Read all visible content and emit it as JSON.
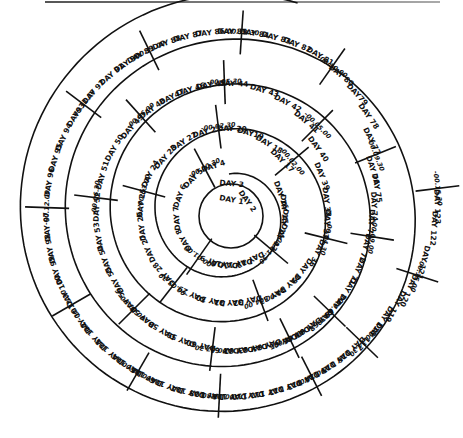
{
  "diagram": {
    "center": [
      229,
      214
    ],
    "spiral_turns": [
      {
        "turn": 1,
        "r_in": 0,
        "r_out": 40
      },
      {
        "turn": 2,
        "r_in": 40,
        "r_out": 70
      },
      {
        "turn": 3,
        "r_in": 70,
        "r_out": 112
      },
      {
        "turn": 4,
        "r_in": 112,
        "r_out": 155
      },
      {
        "turn": 5,
        "r_in": 155,
        "r_out": 200
      }
    ],
    "days": [
      {
        "label": "DAY 1",
        "a": -80,
        "r": 14
      },
      {
        "label": "DAY 2",
        "a": -35,
        "r": 22
      },
      {
        "label": "DAY 3",
        "a": -85,
        "r": 30
      },
      {
        "label": "DAY 4",
        "a": -108,
        "r": 50
      },
      {
        "label": "DAY 5",
        "a": -135,
        "r": 50
      },
      {
        "label": "DAY 6",
        "a": -160,
        "r": 52
      },
      {
        "label": "DAY 7",
        "a": 175,
        "r": 52
      },
      {
        "label": "DAY 8",
        "a": 150,
        "r": 52
      },
      {
        "label": "DAY 9",
        "a": 110,
        "r": 50
      },
      {
        "label": "DAY10",
        "a": 95,
        "r": 50
      },
      {
        "label": "DAY 11",
        "a": 80,
        "r": 50
      },
      {
        "label": "DAY 12",
        "a": 65,
        "r": 50
      },
      {
        "label": "DAY 13",
        "a": 25,
        "r": 55
      },
      {
        "label": "DAY 14",
        "a": 10,
        "r": 55
      },
      {
        "label": "DAY 15",
        "a": -5,
        "r": 55
      },
      {
        "label": "DAY 16",
        "a": -20,
        "r": 55
      },
      {
        "label": "DAY 17",
        "a": -45,
        "r": 75
      },
      {
        "label": "DAY 18",
        "a": -60,
        "r": 80
      },
      {
        "label": "DAY19",
        "a": -75,
        "r": 83
      },
      {
        "label": "DAY 20",
        "a": -88,
        "r": 85
      },
      {
        "label": "DAY 21",
        "a": -105,
        "r": 85
      },
      {
        "label": "DAY 22",
        "a": -122,
        "r": 85
      },
      {
        "label": "DAY 23",
        "a": -138,
        "r": 85
      },
      {
        "label": "DAY 24",
        "a": -153,
        "r": 88
      },
      {
        "label": "DAY 25",
        "a": -173,
        "r": 88
      },
      {
        "label": "DAY 26",
        "a": 172,
        "r": 88
      },
      {
        "label": "DAY 27",
        "a": 157,
        "r": 88
      },
      {
        "label": "DAY 28",
        "a": 137,
        "r": 88
      },
      {
        "label": "DAY 29",
        "a": 115,
        "r": 88
      },
      {
        "label": "DAY 30",
        "a": 102,
        "r": 88
      },
      {
        "label": "DAY 31",
        "a": 90,
        "r": 88
      },
      {
        "label": "DAY 32",
        "a": 78,
        "r": 88
      },
      {
        "label": "DAY 33",
        "a": 62,
        "r": 92
      },
      {
        "label": "DAY 34",
        "a": 50,
        "r": 92
      },
      {
        "label": "DAY 35",
        "a": 38,
        "r": 92
      },
      {
        "label": "DAY 36",
        "a": 24,
        "r": 96
      },
      {
        "label": "DAY 37",
        "a": 6,
        "r": 98
      },
      {
        "label": "DAY 38",
        "a": -7,
        "r": 98
      },
      {
        "label": "DAY 39",
        "a": -22,
        "r": 100
      },
      {
        "label": "DAY 40",
        "a": -36,
        "r": 110
      },
      {
        "label": "DAY 41",
        "a": -50,
        "r": 120
      },
      {
        "label": "DAY 42",
        "a": -62,
        "r": 125
      },
      {
        "label": "DAY 43",
        "a": -74,
        "r": 128
      },
      {
        "label": "DAY 44",
        "a": -88,
        "r": 130
      },
      {
        "label": "DAY 45",
        "a": -98,
        "r": 130
      },
      {
        "label": "DAY 46",
        "a": -107,
        "r": 130
      },
      {
        "label": "DAY47",
        "a": -116,
        "r": 130
      },
      {
        "label": "DAY 48",
        "a": -126,
        "r": 130
      },
      {
        "label": "DAY 49",
        "a": -138,
        "r": 130
      },
      {
        "label": "DAY 50",
        "a": -150,
        "r": 132
      },
      {
        "label": "DAY 51",
        "a": -163,
        "r": 132
      },
      {
        "label": "DAY 52",
        "a": -177,
        "r": 132
      },
      {
        "label": "DAY 53",
        "a": 170,
        "r": 132
      },
      {
        "label": "DAY 54",
        "a": 160,
        "r": 132
      },
      {
        "label": "DAY 55",
        "a": 150,
        "r": 132
      },
      {
        "label": "DAY 56",
        "a": 140,
        "r": 134
      },
      {
        "label": "DAY 57",
        "a": 130,
        "r": 134
      },
      {
        "label": "DAY 58",
        "a": 120,
        "r": 134
      },
      {
        "label": "DAY 59",
        "a": 111,
        "r": 134
      },
      {
        "label": "DAY 60",
        "a": 102,
        "r": 134
      },
      {
        "label": "DAY 61",
        "a": 92,
        "r": 136
      },
      {
        "label": "DAY 62",
        "a": 86,
        "r": 136
      },
      {
        "label": "DAY 63",
        "a": 80,
        "r": 136
      },
      {
        "label": "DAY 64",
        "a": 74,
        "r": 136
      },
      {
        "label": "DAY 65",
        "a": 67,
        "r": 138
      },
      {
        "label": "DAY 66",
        "a": 61,
        "r": 138
      },
      {
        "label": "DAY 67",
        "a": 55,
        "r": 138
      },
      {
        "label": "DAY 68",
        "a": 49,
        "r": 140
      },
      {
        "label": "DAY 69",
        "a": 41,
        "r": 140
      },
      {
        "label": "DAY 70",
        "a": 33,
        "r": 140
      },
      {
        "label": "DAY 71",
        "a": 24,
        "r": 140
      },
      {
        "label": "DAY 72",
        "a": 14,
        "r": 140
      },
      {
        "label": "DAY 73",
        "a": 4,
        "r": 142
      },
      {
        "label": "DAY 74",
        "a": -3,
        "r": 145
      },
      {
        "label": "DAY 75",
        "a": -10,
        "r": 150
      },
      {
        "label": "DAY 76",
        "a": -17,
        "r": 150
      },
      {
        "label": "DAY 77",
        "a": -27,
        "r": 160
      },
      {
        "label": "DAY 78",
        "a": -35,
        "r": 170
      },
      {
        "label": "DAY79",
        "a": -43,
        "r": 175
      },
      {
        "label": "DAY 80",
        "a": -51,
        "r": 178
      },
      {
        "label": "DAY 81",
        "a": -60,
        "r": 182
      },
      {
        "label": "DAY 82",
        "a": -68,
        "r": 182
      },
      {
        "label": "DAY 83",
        "a": -75,
        "r": 182
      },
      {
        "label": "DAY 84",
        "a": -82,
        "r": 182
      },
      {
        "label": "DAY 85",
        "a": -89,
        "r": 182
      },
      {
        "label": "DAY 86",
        "a": -96,
        "r": 182
      },
      {
        "label": "DAY 87",
        "a": -103,
        "r": 182
      },
      {
        "label": "DAY 88",
        "a": -110,
        "r": 182
      },
      {
        "label": "DAY 89",
        "a": -119,
        "r": 182
      },
      {
        "label": "DAY 90",
        "a": -124,
        "r": 182
      },
      {
        "label": "DAY 91",
        "a": -130,
        "r": 182
      },
      {
        "label": "DAY 92",
        "a": -138,
        "r": 182
      },
      {
        "label": "DAY93",
        "a": -147,
        "r": 182
      },
      {
        "label": "DAY 94",
        "a": -155,
        "r": 182
      },
      {
        "label": "DAY 95",
        "a": -162,
        "r": 182
      },
      {
        "label": "DAY 96",
        "a": -170,
        "r": 182
      },
      {
        "label": "DAY 97",
        "a": 176,
        "r": 182
      },
      {
        "label": "DAY 98",
        "a": 169,
        "r": 182
      },
      {
        "label": "DAY 99",
        "a": 162,
        "r": 182
      },
      {
        "label": "DAY 100",
        "a": 155,
        "r": 182
      },
      {
        "label": "DAY 101",
        "a": 145,
        "r": 182
      },
      {
        "label": "DAY 102",
        "a": 138,
        "r": 182
      },
      {
        "label": "DAY 103",
        "a": 131,
        "r": 182
      },
      {
        "label": "DAY 104",
        "a": 124,
        "r": 182
      },
      {
        "label": "DAY 105",
        "a": 117,
        "r": 182
      },
      {
        "label": "DAY 106",
        "a": 110,
        "r": 182
      },
      {
        "label": "DAY 107",
        "a": 103,
        "r": 182
      },
      {
        "label": "DAY 108",
        "a": 97,
        "r": 182
      },
      {
        "label": "DAY 109",
        "a": 90,
        "r": 182
      },
      {
        "label": "DAY110",
        "a": 84,
        "r": 182
      },
      {
        "label": "DAY 111",
        "a": 78,
        "r": 182
      },
      {
        "label": "DAY 112",
        "a": 72,
        "r": 182
      },
      {
        "label": "DAY 113",
        "a": 66,
        "r": 182
      },
      {
        "label": "DAY 114",
        "a": 60,
        "r": 182
      },
      {
        "label": "DAY 115",
        "a": 54,
        "r": 182
      },
      {
        "label": "DAY 116",
        "a": 48,
        "r": 182
      },
      {
        "label": "DAY 117",
        "a": 41,
        "r": 186
      },
      {
        "label": "DAY 118",
        "a": 35,
        "r": 186
      },
      {
        "label": "DAY 119",
        "a": 29,
        "r": 190
      },
      {
        "label": "DAY 120",
        "a": 23,
        "r": 195
      },
      {
        "label": "DAY 121",
        "a": 14,
        "r": 200
      },
      {
        "label": "DAY 122",
        "a": 4,
        "r": 205
      },
      {
        "label": "DAY 123",
        "a": -2,
        "r": 208
      }
    ],
    "time_markers": [
      {
        "label": "-00.00.30",
        "a": -118,
        "r": 52
      },
      {
        "label": "-00.01.00",
        "a": 125,
        "r": 52
      },
      {
        "label": "-00.01.30",
        "a": 40,
        "r": 55
      },
      {
        "label": "-00.02.00",
        "a": -40,
        "r": 82
      },
      {
        "label": "-00.02.30",
        "a": -97,
        "r": 88
      },
      {
        "label": "-00.03.00",
        "a": -165,
        "r": 88
      },
      {
        "label": "-00.03.30",
        "a": 128,
        "r": 90
      },
      {
        "label": "-00.04.00",
        "a": 70,
        "r": 92
      },
      {
        "label": "-00.04.30",
        "a": 14,
        "r": 100
      },
      {
        "label": "-00.05.00",
        "a": -45,
        "r": 125
      },
      {
        "label": "-00.05.30",
        "a": -92,
        "r": 132
      },
      {
        "label": "-00.06.00",
        "a": -132,
        "r": 132
      },
      {
        "label": "-00.06.30",
        "a": -173,
        "r": 134
      },
      {
        "label": "-00.07.00",
        "a": 135,
        "r": 134
      },
      {
        "label": "-00.07.30",
        "a": 97,
        "r": 136
      },
      {
        "label": "-00.08.00",
        "a": 64,
        "r": 138
      },
      {
        "label": "-00.08.30",
        "a": 44,
        "r": 140
      },
      {
        "label": "-00.09.00",
        "a": 9,
        "r": 145
      },
      {
        "label": "-00.09.30",
        "a": -22,
        "r": 158
      },
      {
        "label": "-00.10.00",
        "a": -55,
        "r": 180
      },
      {
        "label": "-00.10.30",
        "a": -86,
        "r": 182
      },
      {
        "label": "-00.11.00",
        "a": -116,
        "r": 182
      },
      {
        "label": "-00.11.30",
        "a": -143,
        "r": 182
      },
      {
        "label": "-00.12.00",
        "a": -178,
        "r": 182
      },
      {
        "label": "-00.12.30",
        "a": 150,
        "r": 182
      },
      {
        "label": "-00.13.00",
        "a": 120,
        "r": 182
      },
      {
        "label": "-00.13.30",
        "a": 93,
        "r": 182
      },
      {
        "label": "-00.14.00",
        "a": 63,
        "r": 182
      },
      {
        "label": "-00.14.30",
        "a": 44,
        "r": 185
      },
      {
        "label": "-00.15.00",
        "a": 18,
        "r": 198
      },
      {
        "label": "-00.15.30",
        "a": -7,
        "r": 210
      }
    ]
  }
}
